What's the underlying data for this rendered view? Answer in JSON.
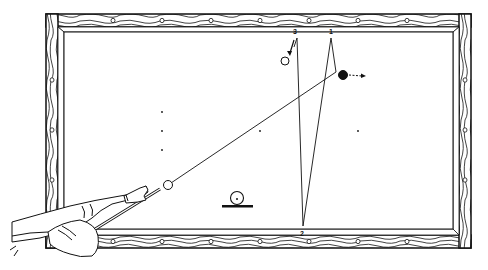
{
  "diagram": {
    "colors": {
      "ink": "#111111",
      "paper": "#ffffff",
      "rail_wood": "#ffffff"
    },
    "table": {
      "outer": {
        "x": 46,
        "y": 14,
        "w": 425,
        "h": 234
      },
      "inner": {
        "x": 64,
        "y": 32,
        "w": 389,
        "h": 197
      }
    },
    "rail_labels": [
      {
        "id": "3",
        "text": "3",
        "x": 295,
        "y": 33
      },
      {
        "id": "1",
        "text": "1",
        "x": 331,
        "y": 33
      },
      {
        "id": "2",
        "text": "2",
        "x": 302,
        "y": 236
      }
    ],
    "top_diamonds_x": [
      113,
      162,
      211,
      260,
      309,
      358,
      407
    ],
    "bottom_diamonds_x": [
      113,
      162,
      211,
      260,
      309,
      358,
      407
    ],
    "left_diamonds_y": [
      80,
      130,
      180
    ],
    "right_diamonds_y": [
      80,
      130,
      180
    ],
    "spots": [
      {
        "x": 162,
        "y": 112
      },
      {
        "x": 162,
        "y": 131
      },
      {
        "x": 162,
        "y": 150
      },
      {
        "x": 260,
        "y": 131
      },
      {
        "x": 358,
        "y": 131
      }
    ],
    "balls": {
      "cue_ball": {
        "label": "cue ball",
        "x": 168,
        "y": 185,
        "r": 4.5,
        "fill": "#ffffff"
      },
      "object_ball_white": {
        "label": "white object ball",
        "x": 285,
        "y": 61,
        "r": 4,
        "fill": "#ffffff"
      },
      "object_ball_black": {
        "label": "black object ball",
        "x": 343,
        "y": 75,
        "r": 4.5,
        "fill": "#111111"
      },
      "ball_on_stand": {
        "label": "ball diagram symbol",
        "x": 237,
        "y": 198,
        "r": 6.5,
        "fill": "#ffffff"
      }
    },
    "paths": {
      "cue_path": [
        [
          168,
          185
        ],
        [
          336,
          72
        ],
        [
          331,
          38
        ],
        [
          303,
          226
        ],
        [
          297,
          38
        ],
        [
          294,
          47
        ]
      ],
      "black_ball_arrow": {
        "from": [
          349,
          75
        ],
        "to": [
          366,
          76
        ],
        "style": "dashed"
      },
      "white_ball_arrow": {
        "from": [
          294,
          38
        ],
        "to": [
          289,
          54
        ]
      }
    },
    "cue": {
      "tip": [
        161,
        189
      ],
      "butt": [
        90,
        232
      ]
    }
  }
}
